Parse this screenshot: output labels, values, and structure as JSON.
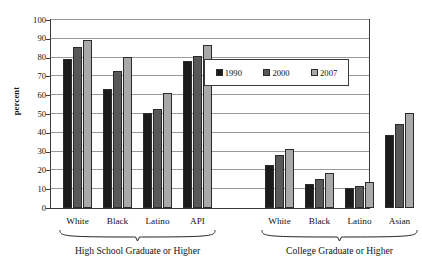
{
  "chart_data": {
    "type": "bar",
    "title": "",
    "xlabel": "",
    "ylabel": "percent",
    "ylim": [
      0,
      100
    ],
    "ytick_step": 10,
    "yticks": [
      0,
      10,
      20,
      30,
      40,
      50,
      60,
      70,
      80,
      90,
      100
    ],
    "grid": "horizontal",
    "legend_position": "upper-center-right",
    "legend": [
      "1990",
      "2000",
      "2007"
    ],
    "series": [
      {
        "name": "1990",
        "color": "#1b1b1b",
        "values": [
          79.0,
          63.5,
          50.5,
          78.0,
          23.0,
          12.8,
          10.6,
          38.6
        ]
      },
      {
        "name": "2000",
        "color": "#585858",
        "values": [
          85.5,
          72.8,
          52.9,
          81.0,
          28.1,
          15.5,
          11.9,
          44.9
        ]
      },
      {
        "name": "2007",
        "color": "#a9a9a9",
        "values": [
          89.6,
          80.5,
          61.4,
          86.7,
          31.5,
          18.6,
          14.0,
          50.7
        ]
      }
    ],
    "categories": [
      "White",
      "Black",
      "Latino",
      "API",
      "White",
      "Black",
      "Latino",
      "Asian"
    ],
    "groups": [
      {
        "caption": "High School Graduate or Higher",
        "categories": [
          "White",
          "Black",
          "Latino",
          "API"
        ]
      },
      {
        "caption": "College Graduate or Higher",
        "categories": [
          "White",
          "Black",
          "Latino",
          "Asian"
        ]
      }
    ]
  },
  "axis": {
    "y_title": "percent"
  }
}
